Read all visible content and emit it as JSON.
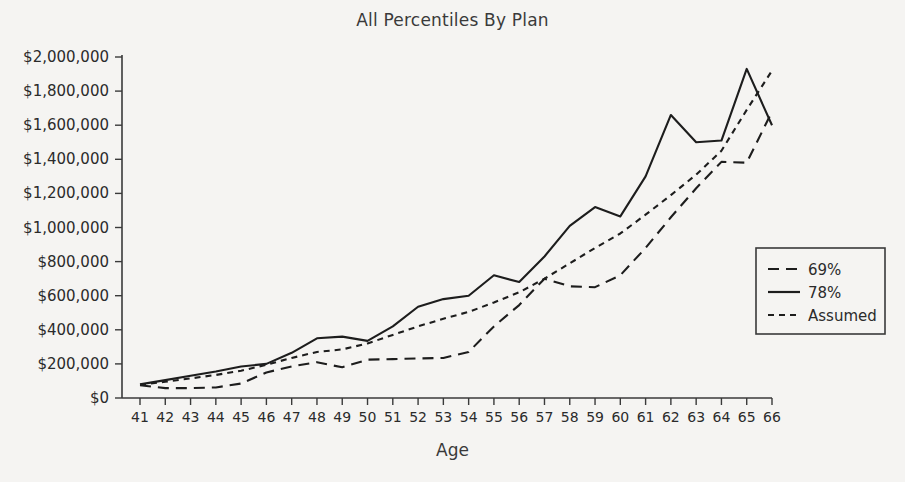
{
  "chart_data": {
    "type": "line",
    "title": "All Percentiles By Plan",
    "xlabel": "Age",
    "ylabel": "",
    "grid": false,
    "legend_position": "right-middle",
    "x": [
      41,
      42,
      43,
      44,
      45,
      46,
      47,
      48,
      49,
      50,
      51,
      52,
      53,
      54,
      55,
      56,
      57,
      58,
      59,
      60,
      61,
      62,
      63,
      64,
      65,
      66
    ],
    "xtick_labels": [
      "41",
      "42",
      "43",
      "44",
      "45",
      "46",
      "47",
      "48",
      "49",
      "50",
      "51",
      "52",
      "53",
      "54",
      "55",
      "56",
      "57",
      "58",
      "59",
      "60",
      "61",
      "62",
      "63",
      "64",
      "65",
      "66"
    ],
    "xlim": [
      41,
      66
    ],
    "ylim": [
      0,
      2000000
    ],
    "ytick_values": [
      0,
      200000,
      400000,
      600000,
      800000,
      1000000,
      1200000,
      1400000,
      1600000,
      1800000,
      2000000
    ],
    "ytick_labels": [
      "$0",
      "$200,000",
      "$400,000",
      "$600,000",
      "$800,000",
      "$1,000,000",
      "$1,200,000",
      "$1,400,000",
      "$1,600,000",
      "$1,800,000",
      "$2,000,000"
    ],
    "series": [
      {
        "name": "69%",
        "style": "dashed",
        "dasharray": "11,7",
        "values": [
          75000,
          58000,
          58000,
          62000,
          85000,
          150000,
          185000,
          210000,
          180000,
          225000,
          228000,
          232000,
          235000,
          270000,
          420000,
          545000,
          700000,
          655000,
          650000,
          720000,
          880000,
          1060000,
          1230000,
          1385000,
          1380000,
          1680000
        ]
      },
      {
        "name": "78%",
        "style": "solid",
        "dasharray": "none",
        "values": [
          80000,
          105000,
          130000,
          155000,
          185000,
          200000,
          265000,
          350000,
          360000,
          335000,
          420000,
          535000,
          580000,
          600000,
          720000,
          680000,
          830000,
          1010000,
          1120000,
          1065000,
          1300000,
          1660000,
          1500000,
          1510000,
          1930000,
          1600000
        ]
      },
      {
        "name": "Assumed",
        "style": "dotted",
        "dasharray": "6,5",
        "values": [
          78000,
          95000,
          115000,
          135000,
          160000,
          195000,
          235000,
          270000,
          285000,
          320000,
          370000,
          420000,
          465000,
          505000,
          560000,
          620000,
          700000,
          790000,
          880000,
          965000,
          1075000,
          1190000,
          1310000,
          1450000,
          1690000,
          1920000
        ]
      }
    ]
  },
  "legend": {
    "items": [
      {
        "label": "69%"
      },
      {
        "label": "78%"
      },
      {
        "label": "Assumed"
      }
    ]
  },
  "colors": {
    "background": "#f5f4f2",
    "ink": "#1d1d1d",
    "axis": "#3a3a3a"
  }
}
